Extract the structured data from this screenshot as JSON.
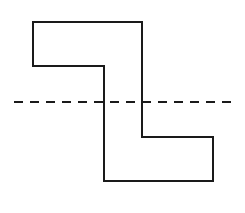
{
  "figure": {
    "background_color": "#ffffff",
    "canvas": {
      "width": 245,
      "height": 213
    },
    "outline": {
      "name": "z-shape-outline",
      "stroke_color": "#1a1a1a",
      "stroke_width": 2,
      "fill": "none",
      "closed": true,
      "points": "33,22 142,22 142,137 213,137 213,181 104,181 104,66 33,66",
      "vertices": [
        {
          "label": "top-left",
          "x": 33,
          "y": 22
        },
        {
          "label": "top-right",
          "x": 142,
          "y": 22
        },
        {
          "label": "right-inner-step",
          "x": 142,
          "y": 137
        },
        {
          "label": "lower-right-top",
          "x": 213,
          "y": 137
        },
        {
          "label": "bottom-right",
          "x": 213,
          "y": 181
        },
        {
          "label": "bottom-left",
          "x": 104,
          "y": 181
        },
        {
          "label": "left-inner-step",
          "x": 104,
          "y": 66
        },
        {
          "label": "upper-left-bottom",
          "x": 33,
          "y": 66
        }
      ]
    },
    "centerline": {
      "name": "horizontal-centerline",
      "stroke_color": "#1a1a1a",
      "stroke_width": 2,
      "dash_length": 9,
      "gap_length": 7,
      "dash_array": "9 7",
      "x_start": 14,
      "x_end": 233,
      "y": 102
    }
  }
}
